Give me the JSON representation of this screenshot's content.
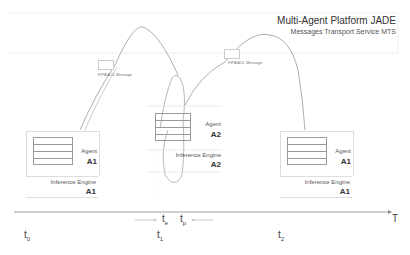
{
  "header": {
    "title": "Multi-Agent Platform JADE",
    "subtitle": "Messages Transport Service MTS"
  },
  "agents": [
    {
      "agent_label": "Agent",
      "agent_id": "A1",
      "engine_label": "Inference Engine",
      "engine_id": "A1"
    },
    {
      "agent_label": "Agent",
      "agent_id": "A2",
      "engine_label": "Inference Engine",
      "engine_id": "A2"
    },
    {
      "agent_label": "Agent",
      "agent_id": "A1",
      "engine_label": "Inference Engine",
      "engine_id": "A1"
    }
  ],
  "messages": [
    {
      "label": "FIPA ACL Message"
    },
    {
      "label": "FIPA ACL Message"
    }
  ],
  "timeline": {
    "axis_label": "T",
    "ticks": [
      {
        "base": "t",
        "sub": "0"
      },
      {
        "base": "t",
        "sub": "1"
      },
      {
        "base": "t",
        "sub": "2"
      }
    ],
    "markers": [
      {
        "base": "t",
        "sub": "e"
      },
      {
        "base": "t",
        "sub": "p"
      }
    ]
  }
}
